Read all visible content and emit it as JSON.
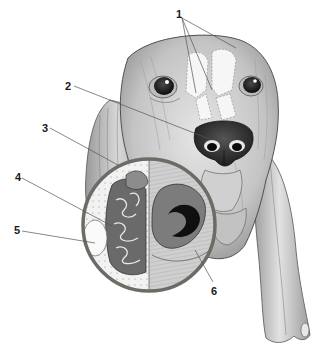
{
  "figure": {
    "callouts": [
      {
        "id": "1",
        "label": "1",
        "x": 176,
        "y": 9
      },
      {
        "id": "2",
        "label": "2",
        "x": 65,
        "y": 81
      },
      {
        "id": "3",
        "label": "3",
        "x": 42,
        "y": 123
      },
      {
        "id": "4",
        "label": "4",
        "x": 15,
        "y": 172
      },
      {
        "id": "5",
        "label": "5",
        "x": 14,
        "y": 225
      },
      {
        "id": "6",
        "label": "6",
        "x": 211,
        "y": 286
      }
    ]
  },
  "colors": {
    "background": "#ffffff",
    "ink": "#1a1a1a",
    "inset_ring": "#6e6a66",
    "skin_mid": "#b8b8b8",
    "skin_light": "#dcdcdc",
    "nose": "#2b2b2b",
    "tissue": "#8a8a8a",
    "sinus": "#f4f4f4"
  }
}
